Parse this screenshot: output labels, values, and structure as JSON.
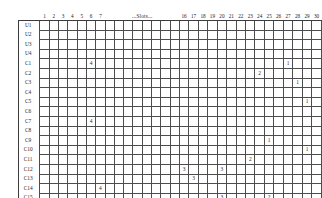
{
  "header": {
    "left_columns": [
      "1",
      "2",
      "3",
      "4",
      "5",
      "6",
      "7"
    ],
    "ellipsis_label": "...Slots...",
    "right_columns": [
      "16",
      "17",
      "18",
      "19",
      "20",
      "21",
      "22",
      "23",
      "24",
      "25",
      "26",
      "27",
      "28",
      "29",
      "30"
    ]
  },
  "grid": {
    "column_count": 30,
    "row_labels": [
      "U1",
      "U2",
      "U3",
      "U4",
      "C1",
      "C2",
      "C3",
      "C4",
      "C5",
      "C6",
      "C7",
      "C8",
      "C9",
      "C10",
      "C11",
      "C12",
      "C13",
      "C14",
      "C15",
      "C16"
    ],
    "filled_cell_color": "#c9c9c9",
    "line_color": "#4d4d4d",
    "break_after_column": 22,
    "rows": [
      {
        "label": "U1",
        "cells": []
      },
      {
        "label": "U2",
        "cells": []
      },
      {
        "label": "U3",
        "cells": []
      },
      {
        "label": "U4",
        "cells": []
      },
      {
        "label": "C1",
        "cells": [
          {
            "col": 6,
            "value": "4"
          },
          {
            "col": 27,
            "value": "1"
          }
        ]
      },
      {
        "label": "C2",
        "cells": [
          {
            "col": 24,
            "value": "2"
          }
        ]
      },
      {
        "label": "C3",
        "cells": [
          {
            "col": 28,
            "value": "1"
          }
        ]
      },
      {
        "label": "C4",
        "cells": []
      },
      {
        "label": "C5",
        "cells": [
          {
            "col": 29,
            "value": "1"
          }
        ]
      },
      {
        "label": "C6",
        "cells": []
      },
      {
        "label": "C7",
        "cells": [
          {
            "col": 6,
            "value": "4"
          }
        ]
      },
      {
        "label": "C8",
        "cells": []
      },
      {
        "label": "C9",
        "cells": [
          {
            "col": 25,
            "value": "1"
          }
        ]
      },
      {
        "label": "C10",
        "cells": [
          {
            "col": 29,
            "value": "1"
          }
        ]
      },
      {
        "label": "C11",
        "cells": [
          {
            "col": 23,
            "value": "2"
          }
        ]
      },
      {
        "label": "C12",
        "cells": [
          {
            "col": 16,
            "value": "3"
          },
          {
            "col": 20,
            "value": "3"
          }
        ]
      },
      {
        "label": "C13",
        "cells": [
          {
            "col": 17,
            "value": "3"
          }
        ]
      },
      {
        "label": "C14",
        "cells": [
          {
            "col": 7,
            "value": "4"
          }
        ]
      },
      {
        "label": "C15",
        "cells": [
          {
            "col": 20,
            "value": "3"
          },
          {
            "col": 25,
            "value": "2"
          }
        ]
      },
      {
        "label": "C16",
        "cells": [
          {
            "col": 4,
            "value": "4"
          }
        ]
      }
    ]
  }
}
